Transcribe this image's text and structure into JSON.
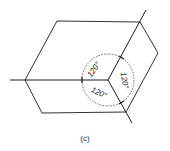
{
  "figure": {
    "caption": "(c)",
    "angles": [
      {
        "label": "120°",
        "position": "upper-left"
      },
      {
        "label": "120°",
        "position": "right"
      },
      {
        "label": "120°",
        "position": "lower-left"
      }
    ],
    "colors": {
      "line": "#1a1a1a",
      "background": "#ffffff"
    }
  }
}
